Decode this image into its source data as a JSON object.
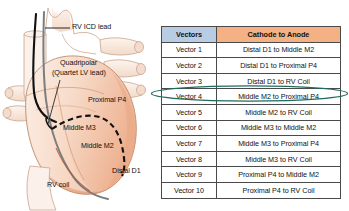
{
  "figure": {
    "background_color": "#ffffff"
  },
  "diagram": {
    "name": "heart-illustration",
    "colors": {
      "heart_fill_light": "#f7dcca",
      "heart_fill_mid": "#f3c7ae",
      "heart_fill_dark": "#e8a883",
      "vessel_fill": "#f7e7da",
      "outline": "#b08a72",
      "rv_icd_lead": "#111111",
      "rv_coil_lead": "#7d7d7d",
      "lv_lead_dashed": "#111111"
    },
    "labels": [
      {
        "id": "rv-icd-lead",
        "text": "RV ICD lead",
        "x": 72,
        "y": 27
      },
      {
        "id": "quadripolar",
        "text": "Quadripolar",
        "x": 60,
        "y": 63
      },
      {
        "id": "quartet-lv",
        "text": "(Quartet LV lead)",
        "x": 52,
        "y": 73
      },
      {
        "id": "proximal-p4",
        "text": "Proximal P4",
        "x": 88,
        "y": 100
      },
      {
        "id": "middle-m3",
        "text": "Middle M3",
        "x": 63,
        "y": 128
      },
      {
        "id": "middle-m2",
        "text": "Middle M2",
        "x": 81,
        "y": 146
      },
      {
        "id": "distal-d1",
        "text": "Distal D1",
        "x": 112,
        "y": 171
      },
      {
        "id": "rv-coil",
        "text": "RV coil",
        "x": 47,
        "y": 185
      }
    ]
  },
  "table": {
    "headers": [
      "Vectors",
      "Cathode to Anode"
    ],
    "header_colors": {
      "vectors": "#b8cce4",
      "cathode": "#f4b183"
    },
    "highlighted_row_index": 3,
    "highlight_color": "#1f6b5e",
    "rows": [
      {
        "vector": "Vector 1",
        "cathode_to_anode": "Distal D1 to Middle M2"
      },
      {
        "vector": "Vector 2",
        "cathode_to_anode": "Distal D1 to Proximal P4"
      },
      {
        "vector": "Vector 3",
        "cathode_to_anode": "Distal D1 to RV Coil"
      },
      {
        "vector": "Vector 4",
        "cathode_to_anode": "Middle M2 to Proximal P4"
      },
      {
        "vector": "Vector 5",
        "cathode_to_anode": "Middle M2 to RV Coil"
      },
      {
        "vector": "Vector 6",
        "cathode_to_anode": "Middle M3 to Middle M2"
      },
      {
        "vector": "Vector 7",
        "cathode_to_anode": "Middle M3 to Proximal P4"
      },
      {
        "vector": "Vector 8",
        "cathode_to_anode": "Middle M3 to RV Coil"
      },
      {
        "vector": "Vector 9",
        "cathode_to_anode": "Proximal P4 to Middle M2"
      },
      {
        "vector": "Vector 10",
        "cathode_to_anode": "Proximal P4 to RV Coil"
      }
    ]
  }
}
